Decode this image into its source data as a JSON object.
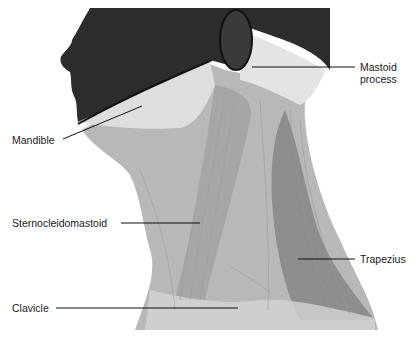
{
  "diagram": {
    "colors": {
      "head_dark": "#2a2a2a",
      "muscle_light": "#c9c9c9",
      "muscle_mid": "#a8a8a8",
      "muscle_dark": "#8a8a8a",
      "highlight": "#eeeeee",
      "leader_line": "#111111",
      "label_text": "#1a1a1a"
    },
    "labels": [
      {
        "id": "mastoid",
        "lines": [
          "Mastoid",
          "process"
        ]
      },
      {
        "id": "mandible",
        "text": "Mandible"
      },
      {
        "id": "scm",
        "text": "Sternocleidomastoid"
      },
      {
        "id": "trapezius",
        "text": "Trapezius"
      },
      {
        "id": "clavicle",
        "text": "Clavicle"
      }
    ]
  }
}
